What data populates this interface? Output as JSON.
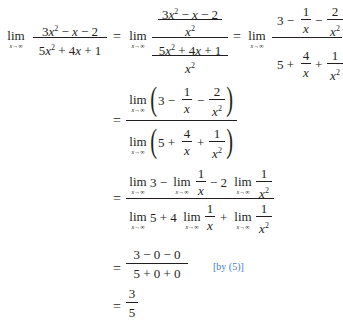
{
  "equation": {
    "lim": "lim",
    "limsub": "x→∞",
    "x": "x",
    "sq": "2",
    "line1": {
      "lhs_num_a": "3",
      "lhs_num_b": " − ",
      "lhs_num_c": " − 2",
      "lhs_den_a": "5",
      "lhs_den_b": " + 4",
      "lhs_den_c": " + 1",
      "mid_num": "3x² − x − 2",
      "mid_den": "5x² + 4x + 1",
      "over": "x²",
      "r_num_3": "3 −",
      "r_num_minus": "−",
      "r_one": "1",
      "r_two": "2",
      "r_four": "4",
      "r_den_5": "5 +",
      "r_den_plus": "+"
    },
    "line2": {
      "num_3": "3 −",
      "num_m": "−",
      "den_5": "5 +",
      "den_p": "+",
      "one": "1",
      "two": "2",
      "four": "4"
    },
    "line3": {
      "num_a": "3 −",
      "num_b": "− 2",
      "den_a": "5 + 4",
      "den_b": "+",
      "one": "1"
    },
    "line4": {
      "num": "3 − 0 − 0",
      "den": "5 + 0 + 0",
      "annotation": "[by (5)]"
    },
    "line5": {
      "num": "3",
      "den": "5"
    },
    "equals": "="
  },
  "colors": {
    "text": "#231f20",
    "annotation": "#3b7cc4"
  }
}
